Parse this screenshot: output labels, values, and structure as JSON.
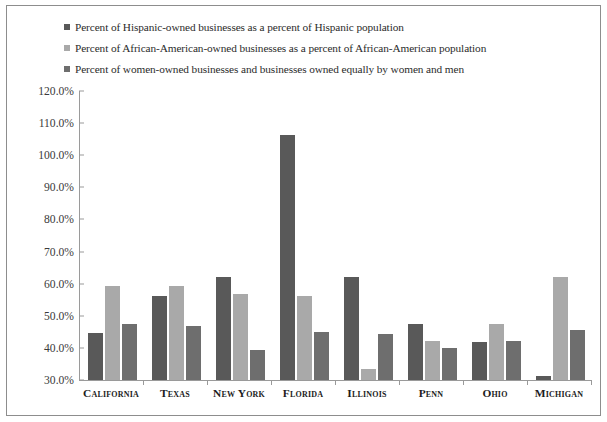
{
  "chart_data": {
    "type": "bar",
    "title": "",
    "xlabel": "",
    "ylabel": "",
    "ylim": [
      30,
      120
    ],
    "ytick_step": 10,
    "ytick_labels": [
      "120.0%",
      "110.0%",
      "100.0%",
      "90.0%",
      "80.0%",
      "70.0%",
      "60.0%",
      "50.0%",
      "40.0%",
      "30.0%"
    ],
    "grid": false,
    "legend_position": "top-left",
    "categories": [
      "California",
      "Texas",
      "New York",
      "Florida",
      "Illinois",
      "Penn",
      "Ohio",
      "Michigan"
    ],
    "series": [
      {
        "name": "Percent of Hispanic-owned businesses as a percent of Hispanic population",
        "color": "#595959",
        "values": [
          44.7,
          56.3,
          62.0,
          106.4,
          62.1,
          47.3,
          41.7,
          31.2
        ]
      },
      {
        "name": "Percent of African-American-owned businesses as a percent of African-American population",
        "color": "#a9a9a9",
        "values": [
          59.3,
          59.3,
          56.8,
          56.1,
          33.3,
          42.1,
          47.6,
          62.1
        ]
      },
      {
        "name": "Percent of women-owned businesses and businesses owned equally by women and men",
        "color": "#6e6e6e",
        "values": [
          47.3,
          46.7,
          39.4,
          44.8,
          44.3,
          40.1,
          42.0,
          45.7
        ]
      }
    ]
  },
  "legend": {
    "items": [
      {
        "label": "Percent of Hispanic-owned businesses as a percent of Hispanic population",
        "color": "#595959"
      },
      {
        "label": "Percent of African-American-owned businesses as a percent of African-American population",
        "color": "#a9a9a9"
      },
      {
        "label": "Percent of women-owned businesses and businesses owned equally by women and men",
        "color": "#6e6e6e"
      }
    ]
  }
}
